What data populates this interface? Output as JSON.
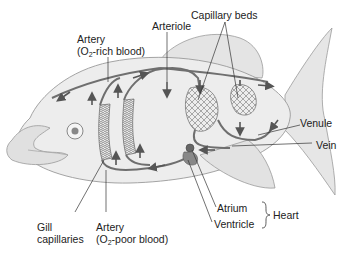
{
  "diagram": {
    "labels": {
      "artery_rich": {
        "line1": "Artery",
        "line2_prefix": "(O",
        "line2_sub": "2",
        "line2_suffix": "-rich blood)"
      },
      "arteriole": "Arteriole",
      "capillary_beds": "Capillary beds",
      "venule": "Venule",
      "vein": "Vein",
      "gill_capillaries": {
        "line1": "Gill",
        "line2": "capillaries"
      },
      "artery_poor": {
        "line1": "Artery",
        "line2_prefix": "(O",
        "line2_sub": "2",
        "line2_suffix": "-poor blood)"
      },
      "atrium": "Atrium",
      "ventricle": "Ventricle",
      "heart": "Heart"
    },
    "colors": {
      "vessel": "#6f6f6f",
      "arrow": "#555555",
      "body_fill": "#ececec",
      "outline": "#9a9a9a",
      "text": "#222222"
    }
  }
}
